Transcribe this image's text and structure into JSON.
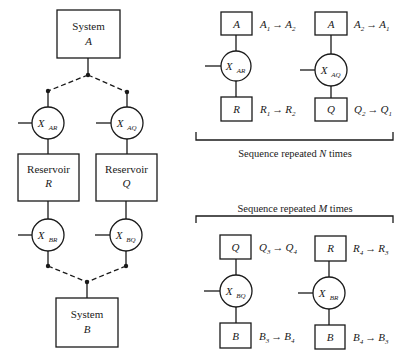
{
  "left_diagram": {
    "system_a": {
      "line1": "System",
      "line2": "A"
    },
    "system_b": {
      "line1": "System",
      "line2": "B"
    },
    "reservoir_r": {
      "line1": "Reservoir",
      "line2": "R"
    },
    "reservoir_q": {
      "line1": "Reservoir",
      "line2": "Q"
    },
    "x_ar": {
      "main": "X",
      "sub": "AR"
    },
    "x_aq": {
      "main": "X",
      "sub": "AQ"
    },
    "x_br": {
      "main": "X",
      "sub": "BR"
    },
    "x_bq": {
      "main": "X",
      "sub": "BQ"
    }
  },
  "sequence_n": {
    "caption_pre": "Sequence repeated ",
    "caption_var": "N",
    "caption_post": " times",
    "col1": {
      "top_box": "A",
      "top_label": {
        "a": "A",
        "as": "1",
        "b": "A",
        "bs": "2"
      },
      "operator": {
        "main": "X",
        "sub": "AR"
      },
      "bottom_box": "R",
      "bottom_label": {
        "a": "R",
        "as": "1",
        "b": "R",
        "bs": "2"
      }
    },
    "col2": {
      "top_box": "A",
      "top_label": {
        "a": "A",
        "as": "2",
        "b": "A",
        "bs": "1"
      },
      "operator": {
        "main": "X",
        "sub": "AQ"
      },
      "bottom_box": "Q",
      "bottom_label": {
        "a": "Q",
        "as": "2",
        "b": "Q",
        "bs": "1"
      }
    }
  },
  "sequence_m": {
    "caption_pre": "Sequence repeated ",
    "caption_var": "M",
    "caption_post": " times",
    "col1": {
      "top_box": "Q",
      "top_label": {
        "a": "Q",
        "as": "3",
        "b": "Q",
        "bs": "4"
      },
      "operator": {
        "main": "X",
        "sub": "BQ"
      },
      "bottom_box": "B",
      "bottom_label": {
        "a": "B",
        "as": "3",
        "b": "B",
        "bs": "4"
      }
    },
    "col2": {
      "top_box": "R",
      "top_label": {
        "a": "R",
        "as": "4",
        "b": "R",
        "bs": "3"
      },
      "operator": {
        "main": "X",
        "sub": "BR"
      },
      "bottom_box": "B",
      "bottom_label": {
        "a": "B",
        "as": "4",
        "b": "B",
        "bs": "3"
      }
    }
  },
  "arrow_glyph": "→"
}
